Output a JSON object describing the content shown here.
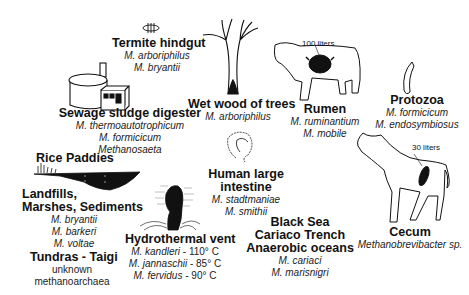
{
  "habitats": [
    {
      "id": "termite",
      "title": [
        "Termite hindgut"
      ],
      "species": [
        "M. arboriphilus",
        "M. bryantii"
      ]
    },
    {
      "id": "sewage",
      "title": [
        "Sewage sludge digester"
      ],
      "species": [
        "M. thermoautotrophicum",
        "M. formicicum",
        "Methanosaeta"
      ]
    },
    {
      "id": "wetwood",
      "title": [
        "Wet wood of trees"
      ],
      "species": [
        "M. arboriphilus"
      ]
    },
    {
      "id": "rumen",
      "title": [
        "Rumen"
      ],
      "species": [
        "M. ruminantium",
        "M. mobile"
      ],
      "note": "100 liters"
    },
    {
      "id": "protozoa",
      "title": [
        "Protozoa"
      ],
      "species": [
        "M. formicicum",
        "M. endosymbiosus"
      ]
    },
    {
      "id": "rice",
      "title": [
        "Rice Paddies"
      ],
      "species": []
    },
    {
      "id": "landfills",
      "title": [
        "Landfills,",
        "Marshes, Sediments"
      ],
      "species": [
        "M. bryantii",
        "M. barkeri",
        "M. voltae"
      ]
    },
    {
      "id": "tundras",
      "title": [
        "Tundras - Taigi"
      ],
      "plain": [
        "unknown",
        "methanoarchaea"
      ]
    },
    {
      "id": "hydrothermal",
      "title": [
        "Hydrothermal vent"
      ],
      "species": [
        "M. kandleri",
        "M. jannaschii",
        "M. fervidus"
      ],
      "temps": [
        " - 110° C",
        " - 85° C",
        " - 90° C"
      ]
    },
    {
      "id": "human",
      "title": [
        "Human large",
        "intestine"
      ],
      "species": [
        "M. stadtmaniae",
        "M. smithii"
      ]
    },
    {
      "id": "oceans",
      "title": [
        "Black Sea",
        "Cariaco Trench",
        "Anaerobic oceans"
      ],
      "species": [
        "M. cariaci",
        "M. marisnigri"
      ]
    },
    {
      "id": "cecum",
      "title": [
        "Cecum"
      ],
      "species": [
        "Methanobrevibacter sp."
      ],
      "note": "30 liters"
    }
  ]
}
